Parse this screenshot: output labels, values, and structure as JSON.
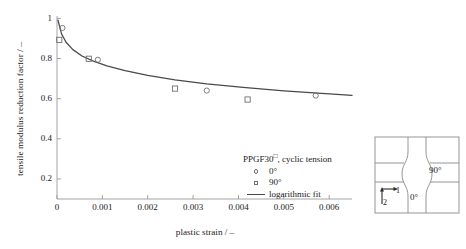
{
  "chart_data": {
    "type": "scatter",
    "title": "",
    "xlabel": "plastic strain / –",
    "ylabel": "tensile modulus reduction factor / –",
    "xlim": [
      0,
      0.0065
    ],
    "ylim": [
      0.1,
      1.02
    ],
    "xticks": [
      0,
      0.001,
      0.002,
      0.003,
      0.004,
      0.005,
      0.006
    ],
    "xticklabels": [
      "0",
      "0.001",
      "0.002",
      "0.003",
      "0.004",
      "0.005",
      "0.006"
    ],
    "yticks": [
      0.2,
      0.4,
      0.6,
      0.8,
      1
    ],
    "yticklabels": [
      "0.2",
      "0.4",
      "0.6",
      "0.8",
      "1"
    ],
    "grid": false,
    "legend_position": "lower-center-right",
    "series": [
      {
        "name": "0°",
        "marker": "open-circle",
        "color": "#6f6f6f",
        "x": [
          0.00012,
          0.0009,
          0.0033,
          0.0057
        ],
        "y": [
          0.96,
          0.8,
          0.645,
          0.62
        ]
      },
      {
        "name": "90°",
        "marker": "open-square",
        "color": "#6f6f6f",
        "x": [
          5e-05,
          0.0007,
          0.0026,
          0.0042
        ],
        "y": [
          0.9,
          0.805,
          0.655,
          0.6
        ]
      },
      {
        "name": "logarithmic fit",
        "marker": "line",
        "color": "#4a4a4a",
        "x": [
          2e-05,
          0.0001,
          0.0002,
          0.00035,
          0.00055,
          0.0008,
          0.0011,
          0.0015,
          0.002,
          0.0026,
          0.0033,
          0.0041,
          0.005,
          0.006,
          0.0065
        ],
        "y": [
          1.0,
          0.93,
          0.888,
          0.851,
          0.819,
          0.793,
          0.769,
          0.745,
          0.721,
          0.699,
          0.679,
          0.661,
          0.644,
          0.628,
          0.621
        ]
      }
    ]
  },
  "legend": {
    "title_main": "PPGF30",
    "title_sup": "□",
    "title_rest": ", cyclic tension",
    "entries": [
      {
        "label": "0°",
        "marker": "open-circle"
      },
      {
        "label": "90°",
        "marker": "open-square"
      },
      {
        "label": "logarithmic fit",
        "marker": "line"
      }
    ]
  },
  "inset": {
    "label_90": "90°",
    "label_0": "0°",
    "axis_1": "1",
    "axis_2": "2"
  },
  "colors": {
    "marker": "#6f6f6f",
    "fit_line": "#4a4a4a",
    "axis": "#9a9a9a",
    "text": "#1a1a1a",
    "inset_line": "#8a8a8a"
  }
}
